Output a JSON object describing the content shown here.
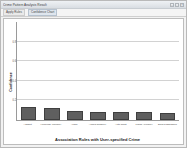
{
  "window": {
    "title": "Crime Pattern Analysis Result",
    "buttons": [
      {
        "name": "minimize",
        "glyph": "–"
      },
      {
        "name": "maximize",
        "glyph": "□"
      },
      {
        "name": "close",
        "glyph": "×"
      }
    ]
  },
  "menubar": {
    "items": [
      {
        "label": "Apply Rules",
        "selected": false
      },
      {
        "label": "Confidence Chart",
        "selected": true
      }
    ]
  },
  "chart_data": {
    "type": "bar",
    "title": "",
    "xlabel": "Association Rules with User-specified Crime",
    "ylabel": "Confidence",
    "categories": [
      "Assault",
      "Homicide (Murder)",
      "Arson",
      "Armed Robbery",
      "Auto Theft",
      "Fraud / Forgery",
      "Drug Possession"
    ],
    "values": [
      0.128,
      0.118,
      0.092,
      0.086,
      0.086,
      0.08,
      0.076
    ],
    "ylim": [
      0,
      1
    ],
    "yticks": [
      0.2,
      0.4,
      0.6,
      0.8
    ],
    "ytick_labels": [
      "0.2",
      "0.4",
      "0.6",
      "0.8"
    ],
    "grid": true,
    "legend": "none",
    "bar_color": "#5f5f5f",
    "bar_edge_color": "#3f3f3f",
    "plot_background": "#ffffff",
    "grid_color": "#d2d2d2"
  }
}
